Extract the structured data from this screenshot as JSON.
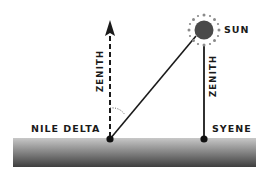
{
  "diagram": {
    "title": "",
    "colors": {
      "background": "#ffffff",
      "ink": "#1a1a1a",
      "sun_fill": "#4a4a4a",
      "sun_rays": "#8a8a8a",
      "ground_top": "#c8c8c8",
      "ground_bottom": "#3e3e3e",
      "angle_arc": "#666666"
    },
    "labels": {
      "sun": "SUN",
      "nile_delta": "NILE DELTA",
      "syene": "SYENE",
      "zenith_left": "ZENITH",
      "zenith_right": "ZENITH"
    },
    "elements": [
      {
        "id": "ground",
        "type": "rect",
        "label": "ground surface"
      },
      {
        "id": "nile-delta-point",
        "type": "point",
        "label": "NILE DELTA"
      },
      {
        "id": "syene-point",
        "type": "point",
        "label": "SYENE"
      },
      {
        "id": "sun",
        "type": "circle",
        "label": "SUN"
      },
      {
        "id": "zenith-nile-delta",
        "type": "dashed-arrow",
        "label": "ZENITH"
      },
      {
        "id": "zenith-syene",
        "type": "solid-line",
        "label": "ZENITH"
      },
      {
        "id": "sun-ray-to-nile-delta",
        "type": "line"
      },
      {
        "id": "angle-arc",
        "type": "dotted-arc"
      }
    ]
  }
}
